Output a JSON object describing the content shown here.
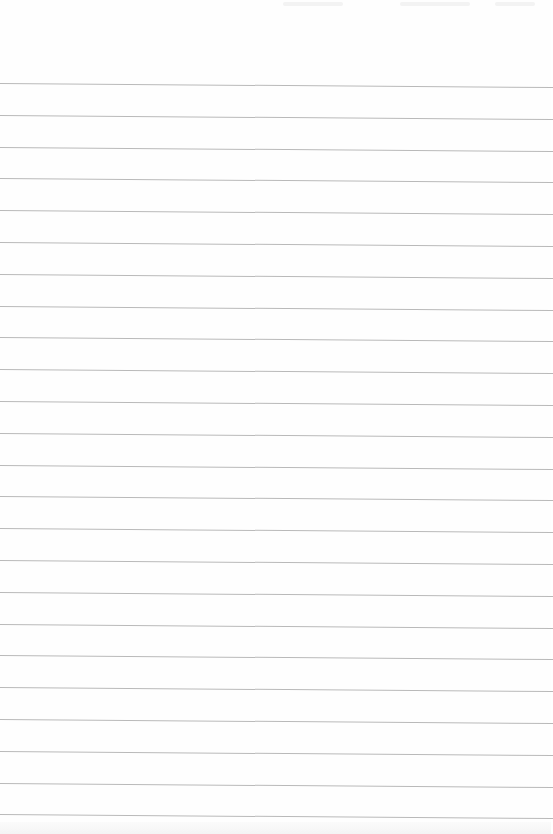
{
  "document": {
    "type": "lined-paper",
    "background_color": "#fefefe",
    "rule_color": "#b9b9b9",
    "rules": {
      "count": 24,
      "first_y": 83,
      "spacing": 31.8,
      "slope_px_across_width": 4
    },
    "text": []
  }
}
